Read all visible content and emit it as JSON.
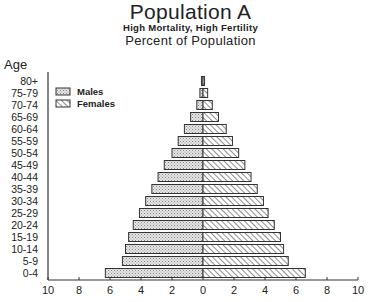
{
  "header": {
    "title": "Population A",
    "subtitle": "High Mortality, High Fertility",
    "subtitle2": "Percent of Population",
    "y_axis_label": "Age"
  },
  "legend": {
    "males_label": "Males",
    "females_label": "Females"
  },
  "colors": {
    "axis": "#333333",
    "bar_stroke": "#333333",
    "males_fill": "#e4e4e4",
    "females_fill": "#ffffff",
    "hatch": "#444444"
  },
  "chart_data": {
    "type": "bar",
    "orientation": "horizontal-population-pyramid",
    "title": "Population A",
    "subtitle": "High Mortality, High Fertility — Percent of Population",
    "xlabel": "",
    "ylabel": "Age",
    "categories": [
      "0-4",
      "5-9",
      "10-14",
      "15-19",
      "20-24",
      "25-29",
      "30-34",
      "35-39",
      "40-44",
      "45-49",
      "50-54",
      "55-59",
      "60-64",
      "65-69",
      "70-74",
      "75-79",
      "80+"
    ],
    "series": [
      {
        "name": "Males",
        "side": "left",
        "pattern": "dotted",
        "values": [
          6.3,
          5.2,
          5.0,
          4.8,
          4.5,
          4.1,
          3.7,
          3.3,
          2.9,
          2.5,
          2.0,
          1.6,
          1.2,
          0.8,
          0.4,
          0.2,
          0.1
        ]
      },
      {
        "name": "Females",
        "side": "right",
        "pattern": "hatched",
        "values": [
          6.6,
          5.5,
          5.2,
          5.0,
          4.6,
          4.2,
          3.9,
          3.5,
          3.1,
          2.7,
          2.3,
          1.9,
          1.5,
          1.0,
          0.6,
          0.3,
          0.1
        ]
      }
    ],
    "x_ticks": [
      10,
      8,
      6,
      4,
      2,
      0,
      2,
      4,
      6,
      8,
      10
    ],
    "xlim": [
      -10,
      10
    ],
    "grid": false,
    "legend_position": "upper-left"
  }
}
